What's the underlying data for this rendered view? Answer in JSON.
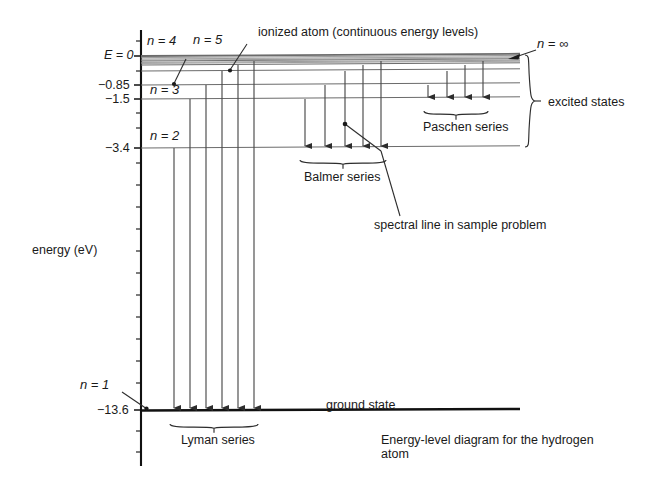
{
  "figure": {
    "caption_line1": "Energy-level diagram for the hydrogen",
    "caption_line2": "atom",
    "axis_label": "energy (eV)"
  },
  "axis": {
    "unit": "eV",
    "ticks": [
      {
        "value": 0,
        "label": "E = 0",
        "y": 56,
        "labeled": true
      },
      {
        "value": -0.85,
        "label": "−0.85",
        "y": 85,
        "labeled": true
      },
      {
        "value": -1.5,
        "label": "−1.5",
        "y": 99,
        "labeled": true
      },
      {
        "value": -3.4,
        "label": "−3.4",
        "y": 148,
        "labeled": true
      },
      {
        "value": -13.6,
        "label": "−13.6",
        "y": 410,
        "labeled": true
      }
    ],
    "minor_ticks_y": [
      41,
      71,
      113,
      128,
      163,
      185,
      207,
      229,
      251,
      273,
      295,
      317,
      339,
      361,
      383,
      431,
      452
    ]
  },
  "levels": [
    {
      "n": "∞",
      "label": "n = ∞",
      "energy": 0,
      "y": 56,
      "kind": "continuum-top"
    },
    {
      "n": "7",
      "label": "",
      "energy": -0.28,
      "y": 61,
      "kind": "continuum"
    },
    {
      "n": "6",
      "label": "",
      "energy": -0.38,
      "y": 65,
      "kind": "continuum"
    },
    {
      "n": "5",
      "label": "n = 5",
      "energy": -0.54,
      "y": 71,
      "kind": "level"
    },
    {
      "n": "4",
      "label": "n = 4",
      "energy": -0.85,
      "y": 85,
      "kind": "level"
    },
    {
      "n": "3",
      "label": "n = 3",
      "energy": -1.5,
      "y": 99,
      "kind": "level"
    },
    {
      "n": "2",
      "label": "n = 2",
      "energy": -3.4,
      "y": 148,
      "kind": "level"
    },
    {
      "n": "1",
      "label": "n = 1",
      "energy": -13.6,
      "y": 410,
      "kind": "ground"
    }
  ],
  "annotations": {
    "continuum": "ionized atom (continuous energy levels)",
    "n_infinity": "n = ∞",
    "n5": "n = 5",
    "n4": "n = 4",
    "n3": "n = 3",
    "n2": "n = 2",
    "n1": "n = 1",
    "excited_states": "excited states",
    "ground_state": "ground state",
    "spectral_line": "spectral line in sample problem"
  },
  "series": [
    {
      "name": "Lyman series",
      "label": "Lyman series",
      "final_level_n": 1,
      "final_y": 410,
      "transitions": [
        {
          "from_n": 2,
          "x": 174,
          "top_y": 148
        },
        {
          "from_n": 3,
          "x": 190,
          "top_y": 99
        },
        {
          "from_n": 4,
          "x": 206,
          "top_y": 85
        },
        {
          "from_n": 5,
          "x": 222,
          "top_y": 71
        },
        {
          "from_n": 6,
          "x": 238,
          "top_y": 65
        },
        {
          "from_n": 7,
          "x": 254,
          "top_y": 61
        }
      ],
      "brace": {
        "x1": 170,
        "x2": 258,
        "y": 424,
        "label_x": 181,
        "label_y": 440
      }
    },
    {
      "name": "Balmer series",
      "label": "Balmer series",
      "final_level_n": 2,
      "final_y": 148,
      "transitions": [
        {
          "from_n": 3,
          "x": 305,
          "top_y": 99
        },
        {
          "from_n": 4,
          "x": 325,
          "top_y": 85
        },
        {
          "from_n": 5,
          "x": 345,
          "top_y": 71
        },
        {
          "from_n": 6,
          "x": 363,
          "top_y": 65
        },
        {
          "from_n": 7,
          "x": 381,
          "top_y": 61
        }
      ],
      "brace": {
        "x1": 300,
        "x2": 386,
        "y": 160,
        "label_x": 304,
        "label_y": 178
      }
    },
    {
      "name": "Paschen series",
      "label": "Paschen series",
      "final_level_n": 3,
      "final_y": 99,
      "transitions": [
        {
          "from_n": 4,
          "x": 428,
          "top_y": 85
        },
        {
          "from_n": 5,
          "x": 447,
          "top_y": 71
        },
        {
          "from_n": 6,
          "x": 465,
          "top_y": 65
        },
        {
          "from_n": 7,
          "x": 483,
          "top_y": 61
        }
      ],
      "brace": {
        "x1": 424,
        "x2": 488,
        "y": 111,
        "label_x": 423,
        "label_y": 128
      }
    }
  ],
  "colors": {
    "ink": "#1a1a1a",
    "level_line": "#6b6b6b",
    "arrow": "#4a4a4a",
    "axis": "#111111",
    "background": "#ffffff"
  }
}
